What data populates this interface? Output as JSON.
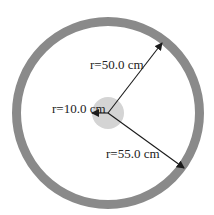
{
  "diagram": {
    "center": {
      "x": 108,
      "y": 113
    },
    "outer_ring": {
      "outer_radius": 96,
      "width": 9,
      "color": "#8a8a8a"
    },
    "inner_disc": {
      "radius": 16,
      "color": "#d4d4d4"
    },
    "arrows": [
      {
        "name": "r50",
        "label": "r=50.0 cm",
        "to": {
          "x": 162,
          "y": 43
        },
        "label_pos": {
          "x": 90,
          "y": 69
        }
      },
      {
        "name": "r10",
        "label": "r=10.0 cm",
        "to": {
          "x": 92,
          "y": 113
        },
        "label_pos": {
          "x": 52,
          "y": 113
        }
      },
      {
        "name": "r55",
        "label": "r=55.0 cm",
        "to": {
          "x": 184,
          "y": 168
        },
        "label_pos": {
          "x": 106,
          "y": 158
        }
      }
    ],
    "arrow_color": "#1a1a1a"
  }
}
